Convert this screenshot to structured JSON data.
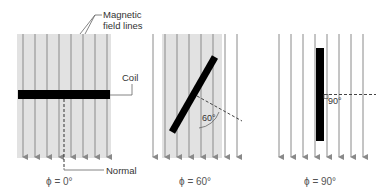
{
  "labels": {
    "field_lines": [
      "Magnetic",
      "field lines"
    ],
    "coil": "Coil",
    "normal": "Normal"
  },
  "panels": [
    {
      "caption": "ϕ = 0°",
      "angle_label": ""
    },
    {
      "caption": "ϕ = 60°",
      "angle_label": "60°"
    },
    {
      "caption": "ϕ = 90°",
      "angle_label": "90°"
    }
  ],
  "colors": {
    "field_line": "#8a8a8a",
    "shading": "#e2e2e2",
    "coil": "#000000",
    "text": "#333333"
  }
}
